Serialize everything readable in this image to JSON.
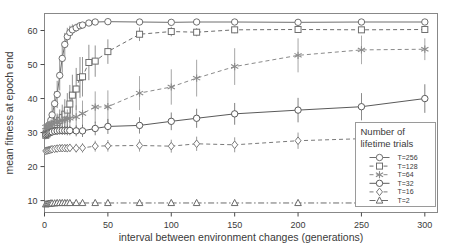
{
  "chart_data": {
    "type": "line",
    "title": "",
    "xlabel": "interval between environment changes (generations)",
    "ylabel": "mean fitness at epoch end",
    "xlim": [
      0,
      310
    ],
    "ylim": [
      6.5,
      65
    ],
    "xticks": [
      0,
      50,
      100,
      150,
      200,
      250,
      300
    ],
    "yticks": [
      10,
      20,
      30,
      40,
      50,
      60
    ],
    "grid": false,
    "legend_position": "bottom-right",
    "legend_title_line1": "Number of",
    "legend_title_line2": "lifetime trials",
    "errorbars": true,
    "series": [
      {
        "name": "T=256",
        "marker": "circle",
        "linestyle": "solid",
        "color": "#6e6e6e",
        "x": [
          1,
          2,
          3,
          4,
          5,
          6,
          8,
          10,
          12,
          14,
          16,
          18,
          20,
          22,
          25,
          28,
          30,
          35,
          40,
          50,
          75,
          100,
          120,
          150,
          200,
          250,
          300
        ],
        "y": [
          30.0,
          30.6,
          31.4,
          32.4,
          33.6,
          35.2,
          38.5,
          41.2,
          46.8,
          51.8,
          55.9,
          58.2,
          59.4,
          60.2,
          60.8,
          61.4,
          61.6,
          62.2,
          62.5,
          62.6,
          62.5,
          62.4,
          62.5,
          62.5,
          62.4,
          62.5,
          62.5
        ],
        "yerr": [
          1.6,
          1.8,
          2.0,
          2.2,
          2.6,
          3.0,
          3.6,
          4.0,
          4.4,
          4.2,
          3.4,
          2.6,
          2.0,
          1.6,
          1.2,
          1.0,
          0.9,
          0.7,
          0.6,
          0.5,
          0.4,
          0.4,
          0.4,
          0.4,
          0.4,
          0.4,
          0.4
        ]
      },
      {
        "name": "T=128",
        "marker": "square",
        "linestyle": "dashed",
        "color": "#6e6e6e",
        "x": [
          1,
          2,
          3,
          4,
          5,
          6,
          8,
          10,
          12,
          14,
          16,
          18,
          20,
          22,
          25,
          28,
          30,
          35,
          40,
          50,
          75,
          100,
          120,
          150,
          200,
          250,
          300
        ],
        "y": [
          29.2,
          29.6,
          30.0,
          30.5,
          31.0,
          31.6,
          32.4,
          33.0,
          33.6,
          34.4,
          35.4,
          36.6,
          38.4,
          41.0,
          42.8,
          46.2,
          46.4,
          50.6,
          51.0,
          53.8,
          58.9,
          59.7,
          59.5,
          60.2,
          60.3,
          60.2,
          60.3
        ],
        "yerr": [
          1.2,
          1.3,
          1.4,
          1.5,
          1.6,
          1.8,
          2.2,
          2.6,
          3.2,
          3.8,
          4.4,
          5.0,
          5.6,
          6.0,
          6.2,
          6.0,
          5.8,
          5.2,
          4.6,
          3.6,
          2.0,
          1.4,
          1.2,
          1.0,
          0.9,
          0.8,
          0.8
        ]
      },
      {
        "name": "T=64",
        "marker": "star",
        "linestyle": "dashed",
        "color": "#8a8a8a",
        "x": [
          1,
          2,
          3,
          4,
          5,
          6,
          8,
          10,
          12,
          14,
          16,
          18,
          20,
          25,
          30,
          40,
          50,
          75,
          100,
          120,
          150,
          200,
          250,
          300
        ],
        "y": [
          31.6,
          31.8,
          32.0,
          32.2,
          32.4,
          32.6,
          32.9,
          33.2,
          33.4,
          33.6,
          33.8,
          34.0,
          34.2,
          34.6,
          35.6,
          37.5,
          37.6,
          41.6,
          43.4,
          46.0,
          49.4,
          52.7,
          54.3,
          54.5
        ],
        "yerr": [
          1.0,
          1.1,
          1.2,
          1.3,
          1.4,
          1.6,
          1.8,
          2.0,
          2.2,
          2.4,
          2.6,
          2.8,
          3.0,
          3.4,
          3.8,
          4.6,
          4.8,
          5.0,
          5.2,
          5.4,
          5.4,
          5.0,
          4.2,
          3.2
        ]
      },
      {
        "name": "T=32",
        "marker": "circle",
        "linestyle": "solid",
        "color": "#5a5a5a",
        "x": [
          1,
          2,
          3,
          4,
          5,
          6,
          8,
          10,
          12,
          14,
          16,
          18,
          20,
          25,
          30,
          40,
          50,
          75,
          100,
          120,
          150,
          200,
          250,
          300
        ],
        "y": [
          29.4,
          29.6,
          29.8,
          30.0,
          30.1,
          30.2,
          30.4,
          30.5,
          30.6,
          30.6,
          30.6,
          30.6,
          30.6,
          30.5,
          30.5,
          31.2,
          31.8,
          32.1,
          33.3,
          34.2,
          35.5,
          36.6,
          37.6,
          40.0
        ],
        "yerr": [
          0.8,
          0.8,
          0.9,
          0.9,
          1.0,
          1.0,
          1.1,
          1.2,
          1.2,
          1.3,
          1.3,
          1.4,
          1.4,
          1.6,
          1.8,
          2.0,
          2.2,
          2.4,
          2.6,
          2.8,
          3.2,
          3.6,
          4.0,
          4.2
        ]
      },
      {
        "name": "T=16",
        "marker": "diamond",
        "linestyle": "dashed",
        "color": "#7a7a7a",
        "x": [
          1,
          2,
          3,
          4,
          5,
          6,
          8,
          10,
          12,
          14,
          16,
          18,
          20,
          25,
          30,
          40,
          50,
          75,
          100,
          120,
          150,
          200,
          250,
          300
        ],
        "y": [
          24.6,
          24.7,
          24.8,
          24.9,
          25.0,
          25.1,
          25.2,
          25.3,
          25.4,
          25.4,
          25.4,
          25.4,
          25.5,
          25.4,
          25.5,
          26.0,
          26.1,
          26.2,
          26.0,
          26.7,
          26.4,
          27.6,
          28.2,
          28.4
        ],
        "yerr": [
          0.7,
          0.7,
          0.8,
          0.8,
          0.8,
          0.9,
          0.9,
          1.0,
          1.0,
          1.1,
          1.1,
          1.2,
          1.2,
          1.3,
          1.4,
          1.6,
          1.7,
          1.8,
          1.9,
          2.1,
          2.2,
          2.4,
          2.6,
          2.8
        ]
      },
      {
        "name": "T=2",
        "marker": "triangle",
        "linestyle": "dashdot",
        "color": "#6a6a6a",
        "x": [
          1,
          2,
          3,
          4,
          5,
          6,
          8,
          10,
          12,
          14,
          16,
          18,
          20,
          25,
          30,
          40,
          50,
          75,
          100,
          120,
          150,
          200,
          250,
          300
        ],
        "y": [
          8.9,
          9.0,
          9.1,
          9.1,
          9.2,
          9.2,
          9.2,
          9.3,
          9.3,
          9.3,
          9.3,
          9.3,
          9.3,
          9.3,
          9.3,
          9.3,
          9.3,
          9.3,
          9.3,
          9.3,
          9.3,
          9.3,
          9.3,
          9.3
        ],
        "yerr": [
          0.3,
          0.3,
          0.3,
          0.3,
          0.3,
          0.3,
          0.3,
          0.3,
          0.3,
          0.3,
          0.3,
          0.3,
          0.3,
          0.3,
          0.3,
          0.3,
          0.3,
          0.3,
          0.3,
          0.3,
          0.3,
          0.3,
          0.3,
          0.3
        ]
      }
    ]
  }
}
